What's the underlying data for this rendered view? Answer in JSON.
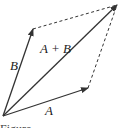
{
  "diagram": {
    "type": "vector-parallelogram",
    "vectors": [
      {
        "id": "A",
        "label": "A",
        "from": [
          3,
          116
        ],
        "to": [
          88,
          88
        ]
      },
      {
        "id": "B",
        "label": "B",
        "from": [
          3,
          116
        ],
        "to": [
          33,
          29
        ]
      },
      {
        "id": "sum",
        "label": "A + B",
        "from": [
          3,
          116
        ],
        "to": [
          117,
          5
        ]
      }
    ],
    "dashed_edges": [
      {
        "from": [
          33,
          29
        ],
        "to": [
          117,
          5
        ]
      },
      {
        "from": [
          88,
          88
        ],
        "to": [
          117,
          5
        ]
      }
    ],
    "labels": {
      "a": "A",
      "b": "B",
      "sum": "A + B"
    },
    "caption": "Figure"
  }
}
